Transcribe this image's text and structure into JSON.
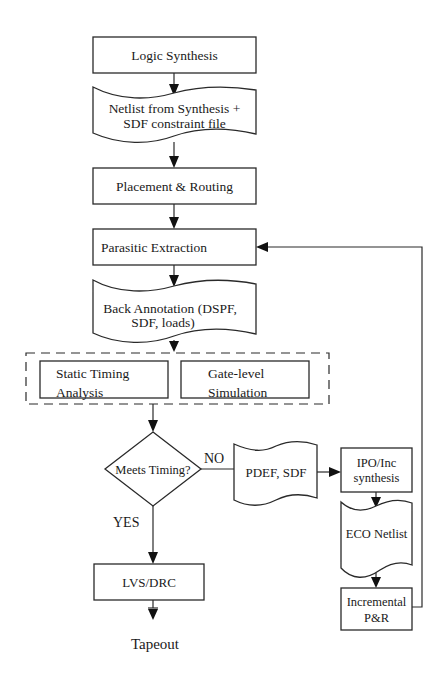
{
  "diagram": {
    "type": "flowchart",
    "nodes": {
      "logic_synthesis": {
        "label": "Logic Synthesis",
        "shape": "process"
      },
      "netlist": {
        "line1": "Netlist from Synthesis +",
        "line2": "SDF constraint file",
        "shape": "document"
      },
      "placement_routing": {
        "label": "Placement & Routing",
        "shape": "process"
      },
      "parasitic_extraction": {
        "label": "Parasitic Extraction",
        "shape": "process"
      },
      "back_annotation": {
        "line1": "Back Annotation (DSPF,",
        "line2": "SDF, loads)",
        "shape": "document"
      },
      "static_timing": {
        "line1": "Static Timing",
        "line2": "Analysis",
        "shape": "process"
      },
      "gate_level_sim": {
        "line1": "Gate-level",
        "line2": "Simulation",
        "shape": "process"
      },
      "meets_timing": {
        "label": "Meets Timing?",
        "shape": "decision"
      },
      "pdef_sdf": {
        "label": "PDEF, SDF",
        "shape": "document"
      },
      "ipo_inc": {
        "line1": "IPO/Inc",
        "line2": "synthesis",
        "shape": "process"
      },
      "eco_netlist": {
        "label": "ECO Netlist",
        "shape": "document"
      },
      "incremental_pr": {
        "line1": "Incremental",
        "line2": "P&R",
        "shape": "process"
      },
      "lvs_drc": {
        "label": "LVS/DRC",
        "shape": "process"
      },
      "tapeout": {
        "label": "Tapeout",
        "shape": "terminal-text"
      }
    },
    "edge_labels": {
      "no": "NO",
      "yes": "YES"
    },
    "edges": [
      {
        "from": "logic_synthesis",
        "to": "netlist"
      },
      {
        "from": "netlist",
        "to": "placement_routing"
      },
      {
        "from": "placement_routing",
        "to": "parasitic_extraction"
      },
      {
        "from": "parasitic_extraction",
        "to": "back_annotation"
      },
      {
        "from": "back_annotation",
        "to": "analysis_group"
      },
      {
        "from": "analysis_group",
        "to": "meets_timing"
      },
      {
        "from": "meets_timing",
        "to": "pdef_sdf",
        "label": "NO"
      },
      {
        "from": "pdef_sdf",
        "to": "ipo_inc"
      },
      {
        "from": "ipo_inc",
        "to": "eco_netlist"
      },
      {
        "from": "eco_netlist",
        "to": "incremental_pr"
      },
      {
        "from": "incremental_pr",
        "to": "parasitic_extraction",
        "type": "feedback"
      },
      {
        "from": "meets_timing",
        "to": "lvs_drc",
        "label": "YES"
      },
      {
        "from": "lvs_drc",
        "to": "tapeout"
      }
    ],
    "groups": [
      {
        "name": "analysis_group",
        "style": "dashed",
        "members": [
          "static_timing",
          "gate_level_sim"
        ]
      }
    ]
  }
}
